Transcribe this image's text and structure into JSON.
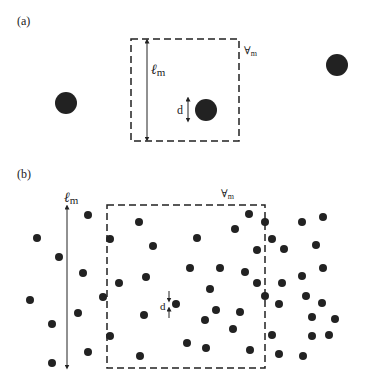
{
  "panels": [
    {
      "label": "(a)",
      "box": {
        "x": 131,
        "y": 39,
        "w": 108,
        "h": 102
      },
      "volume_label": "∀",
      "volume_sub": "m",
      "length_label": "ℓ",
      "length_sub": "m",
      "diameter_label": "d",
      "particle_radius": 11,
      "particles": [
        [
          66,
          103
        ],
        [
          206,
          110
        ],
        [
          337,
          65
        ]
      ]
    },
    {
      "label": "(b)",
      "box": {
        "x": 107,
        "y": 205,
        "w": 158,
        "h": 163
      },
      "volume_label": "∀",
      "volume_sub": "m",
      "length_label": "ℓ",
      "length_sub": "m",
      "diameter_label": "d",
      "particle_radius": 4,
      "particles": [
        [
          88,
          215
        ],
        [
          37,
          238
        ],
        [
          59,
          257
        ],
        [
          83,
          273
        ],
        [
          30,
          300
        ],
        [
          103,
          297
        ],
        [
          78,
          313
        ],
        [
          52,
          324
        ],
        [
          88,
          352
        ],
        [
          52,
          363
        ],
        [
          139,
          222
        ],
        [
          110,
          239
        ],
        [
          153,
          246
        ],
        [
          146,
          277
        ],
        [
          119,
          283
        ],
        [
          176,
          304
        ],
        [
          144,
          315
        ],
        [
          110,
          336
        ],
        [
          140,
          356
        ],
        [
          187,
          343
        ],
        [
          249,
          214
        ],
        [
          235,
          229
        ],
        [
          197,
          238
        ],
        [
          257,
          250
        ],
        [
          190,
          268
        ],
        [
          220,
          268
        ],
        [
          245,
          272
        ],
        [
          257,
          283
        ],
        [
          210,
          289
        ],
        [
          216,
          310
        ],
        [
          240,
          312
        ],
        [
          205,
          320
        ],
        [
          233,
          329
        ],
        [
          206,
          348
        ],
        [
          250,
          350
        ],
        [
          265,
          222
        ],
        [
          302,
          222
        ],
        [
          323,
          217
        ],
        [
          272,
          239
        ],
        [
          284,
          249
        ],
        [
          316,
          245
        ],
        [
          323,
          268
        ],
        [
          302,
          276
        ],
        [
          282,
          283
        ],
        [
          265,
          296
        ],
        [
          306,
          296
        ],
        [
          279,
          304
        ],
        [
          322,
          303
        ],
        [
          312,
          317
        ],
        [
          335,
          319
        ],
        [
          272,
          335
        ],
        [
          312,
          336
        ],
        [
          329,
          335
        ],
        [
          279,
          354
        ],
        [
          303,
          356
        ]
      ]
    }
  ],
  "colors": {
    "particle": "#222222",
    "line": "#222222"
  }
}
